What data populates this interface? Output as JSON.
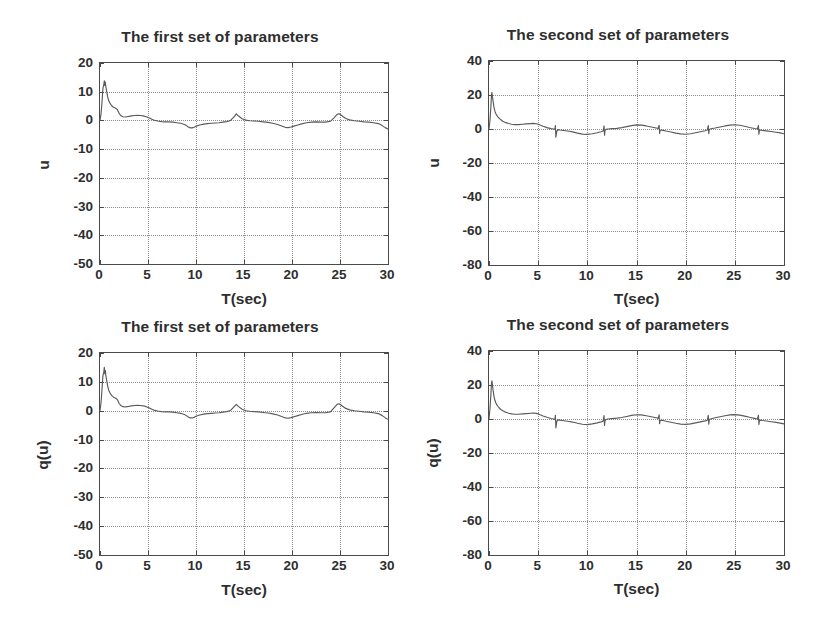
{
  "figure": {
    "background": "#ffffff",
    "line_color": "#5a5a5a",
    "axis_color": "#4a4a4a",
    "grid_color": "#8d8d8d"
  },
  "panels": [
    {
      "id": "top-left",
      "title": "The first set of parameters",
      "xlabel": "T(sec)",
      "ylabel": "u",
      "xticks": [
        "0",
        "5",
        "10",
        "15",
        "20",
        "25",
        "30"
      ],
      "yticks": [
        "20",
        "10",
        "0",
        "-10",
        "-20",
        "-30",
        "-40",
        "-50"
      ]
    },
    {
      "id": "top-right",
      "title": "The second set of parameters",
      "xlabel": "T(sec)",
      "ylabel": "u",
      "xticks": [
        "0",
        "5",
        "10",
        "15",
        "20",
        "25",
        "30"
      ],
      "yticks": [
        "40",
        "20",
        "0",
        "-20",
        "-40",
        "-60",
        "-80"
      ]
    },
    {
      "id": "bottom-left",
      "title": "The first set of parameters",
      "xlabel": "T(sec)",
      "ylabel": "q(u)",
      "xticks": [
        "0",
        "5",
        "10",
        "15",
        "20",
        "25",
        "30"
      ],
      "yticks": [
        "20",
        "10",
        "0",
        "-10",
        "-20",
        "-30",
        "-40",
        "-50"
      ]
    },
    {
      "id": "bottom-right",
      "title": "The second set of parameters",
      "xlabel": "T(sec)",
      "ylabel": "q(u)",
      "xticks": [
        "0",
        "5",
        "10",
        "15",
        "20",
        "25",
        "30"
      ],
      "yticks": [
        "40",
        "20",
        "0",
        "-20",
        "-40",
        "-60",
        "-80"
      ]
    }
  ],
  "chart_data": [
    {
      "type": "line",
      "id": "top-left",
      "title": "The first set of parameters",
      "xlabel": "T(sec)",
      "ylabel": "u",
      "xlim": [
        0,
        30
      ],
      "ylim": [
        -50,
        20
      ],
      "xticks": [
        0,
        5,
        10,
        15,
        20,
        25,
        30
      ],
      "yticks": [
        -50,
        -40,
        -30,
        -20,
        -10,
        0,
        10,
        20
      ],
      "grid": true,
      "legend": null,
      "series": [
        {
          "name": "u",
          "x": [
            0.0,
            0.1,
            0.2,
            0.3,
            0.4,
            0.45,
            0.5,
            0.55,
            0.6,
            0.7,
            0.8,
            0.9,
            1.0,
            1.2,
            1.4,
            1.6,
            1.8,
            2.0,
            2.2,
            2.4,
            2.6,
            2.8,
            3.0,
            3.3,
            3.6,
            3.9,
            4.2,
            4.5,
            4.8,
            5.1,
            5.4,
            5.7,
            6.0,
            6.4,
            6.8,
            7.2,
            7.6,
            8.0,
            8.4,
            8.8,
            9.0,
            9.2,
            9.4,
            9.6,
            9.8,
            10.0,
            10.4,
            10.8,
            11.2,
            11.6,
            12.0,
            12.4,
            12.8,
            13.2,
            13.6,
            14.0,
            14.2,
            14.4,
            14.8,
            15.2,
            15.6,
            16.0,
            16.5,
            17.0,
            17.5,
            18.0,
            18.5,
            19.0,
            19.3,
            19.6,
            19.9,
            20.2,
            20.6,
            21.0,
            21.5,
            22.0,
            22.5,
            23.0,
            23.5,
            24.0,
            24.4,
            24.7,
            24.9,
            25.2,
            25.6,
            26.0,
            26.5,
            27.0,
            27.5,
            28.0,
            28.5,
            29.0,
            29.4,
            29.7,
            30.0
          ],
          "y": [
            0.0,
            2.0,
            6.0,
            11.0,
            12.6,
            13.8,
            12.2,
            13.4,
            12.0,
            10.0,
            8.2,
            7.0,
            6.2,
            5.2,
            4.6,
            4.3,
            3.8,
            2.4,
            1.6,
            1.3,
            1.2,
            1.3,
            1.4,
            1.6,
            1.7,
            1.8,
            1.7,
            1.6,
            1.3,
            0.9,
            0.4,
            0.0,
            -0.2,
            -0.4,
            -0.5,
            -0.5,
            -0.6,
            -0.8,
            -1.0,
            -1.4,
            -1.8,
            -2.3,
            -2.6,
            -2.6,
            -2.4,
            -2.0,
            -1.6,
            -1.3,
            -1.1,
            -1.0,
            -0.9,
            -0.8,
            -0.6,
            -0.4,
            0.0,
            1.4,
            2.3,
            1.6,
            0.6,
            0.1,
            -0.1,
            -0.2,
            -0.3,
            -0.5,
            -0.7,
            -1.0,
            -1.4,
            -2.0,
            -2.4,
            -2.5,
            -2.3,
            -2.0,
            -1.6,
            -1.2,
            -0.8,
            -0.6,
            -0.5,
            -0.6,
            -0.6,
            -0.3,
            1.0,
            2.1,
            2.3,
            1.6,
            0.7,
            0.2,
            -0.1,
            -0.3,
            -0.5,
            -0.6,
            -0.8,
            -1.1,
            -1.8,
            -2.5,
            -3.0
          ]
        }
      ]
    },
    {
      "type": "line",
      "id": "top-right",
      "title": "The second set of parameters",
      "xlabel": "T(sec)",
      "ylabel": "u",
      "xlim": [
        0,
        30
      ],
      "ylim": [
        -80,
        40
      ],
      "xticks": [
        0,
        5,
        10,
        15,
        20,
        25,
        30
      ],
      "yticks": [
        -80,
        -60,
        -40,
        -20,
        0,
        20,
        40
      ],
      "grid": true,
      "legend": null,
      "series": [
        {
          "name": "u",
          "x": [
            0.0,
            0.1,
            0.2,
            0.25,
            0.3,
            0.35,
            0.4,
            0.5,
            0.6,
            0.7,
            0.8,
            0.9,
            1.0,
            1.2,
            1.4,
            1.6,
            1.8,
            2.0,
            2.3,
            2.6,
            3.0,
            3.4,
            3.8,
            4.2,
            4.5,
            4.8,
            5.0,
            5.2,
            5.5,
            5.9,
            6.3,
            6.6,
            6.7,
            6.75,
            6.8,
            6.9,
            7.0,
            7.2,
            7.6,
            8.0,
            8.5,
            9.0,
            9.5,
            10.0,
            10.5,
            11.0,
            11.4,
            11.6,
            11.7,
            11.75,
            11.8,
            11.9,
            12.1,
            12.5,
            13.0,
            13.5,
            14.0,
            14.5,
            15.0,
            15.5,
            16.0,
            16.5,
            17.0,
            17.2,
            17.3,
            17.35,
            17.4,
            17.5,
            17.7,
            18.0,
            18.5,
            19.0,
            19.5,
            20.0,
            20.5,
            21.0,
            21.5,
            22.0,
            22.2,
            22.3,
            22.35,
            22.4,
            22.5,
            22.7,
            23.0,
            23.5,
            24.0,
            24.5,
            25.0,
            25.5,
            26.0,
            26.5,
            27.0,
            27.3,
            27.4,
            27.45,
            27.5,
            27.6,
            27.8,
            28.2,
            28.7,
            29.2,
            29.6,
            30.0
          ],
          "y": [
            0.0,
            5.0,
            14.0,
            20.0,
            21.5,
            19.0,
            17.0,
            13.0,
            10.5,
            9.0,
            8.0,
            7.2,
            6.5,
            5.4,
            4.6,
            4.0,
            3.6,
            3.2,
            2.8,
            2.6,
            2.6,
            2.8,
            3.0,
            3.2,
            3.3,
            3.1,
            2.8,
            2.3,
            1.6,
            0.8,
            0.2,
            0.0,
            -0.3,
            2.0,
            -4.8,
            -1.2,
            -0.4,
            -0.6,
            -0.9,
            -1.2,
            -1.7,
            -2.4,
            -3.0,
            -3.2,
            -2.8,
            -2.2,
            -1.6,
            -1.2,
            1.8,
            -3.6,
            -0.8,
            -0.2,
            0.0,
            0.2,
            0.4,
            0.8,
            1.4,
            2.0,
            2.4,
            2.3,
            1.8,
            1.2,
            0.6,
            0.3,
            2.2,
            -2.6,
            -0.8,
            -0.6,
            -0.8,
            -1.2,
            -1.8,
            -2.4,
            -2.9,
            -3.1,
            -2.8,
            -2.2,
            -1.6,
            -1.0,
            -0.6,
            2.0,
            -2.8,
            -0.4,
            0.0,
            0.3,
            0.6,
            1.2,
            1.8,
            2.3,
            2.5,
            2.2,
            1.6,
            0.9,
            0.3,
            0.0,
            2.1,
            -3.0,
            -0.8,
            -0.6,
            -0.8,
            -1.1,
            -1.5,
            -1.9,
            -2.3,
            -2.8
          ]
        }
      ]
    },
    {
      "type": "line",
      "id": "bottom-left",
      "title": "The first set of parameters",
      "xlabel": "T(sec)",
      "ylabel": "q(u)",
      "xlim": [
        0,
        30
      ],
      "ylim": [
        -50,
        20
      ],
      "xticks": [
        0,
        5,
        10,
        15,
        20,
        25,
        30
      ],
      "yticks": [
        -50,
        -40,
        -30,
        -20,
        -10,
        0,
        10,
        20
      ],
      "grid": true,
      "legend": null,
      "series": [
        {
          "name": "q(u)",
          "x": [
            0.0,
            0.1,
            0.2,
            0.3,
            0.4,
            0.45,
            0.5,
            0.55,
            0.6,
            0.7,
            0.8,
            0.9,
            1.0,
            1.2,
            1.4,
            1.6,
            1.8,
            2.0,
            2.2,
            2.4,
            2.6,
            2.8,
            3.0,
            3.3,
            3.6,
            3.9,
            4.2,
            4.5,
            4.8,
            5.1,
            5.4,
            5.7,
            6.0,
            6.4,
            6.8,
            7.2,
            7.6,
            8.0,
            8.4,
            8.8,
            9.0,
            9.2,
            9.4,
            9.6,
            9.8,
            10.0,
            10.4,
            10.8,
            11.2,
            11.6,
            12.0,
            12.4,
            12.8,
            13.2,
            13.6,
            14.0,
            14.2,
            14.4,
            14.8,
            15.2,
            15.6,
            16.0,
            16.5,
            17.0,
            17.5,
            18.0,
            18.5,
            19.0,
            19.3,
            19.6,
            19.9,
            20.2,
            20.6,
            21.0,
            21.5,
            22.0,
            22.5,
            23.0,
            23.5,
            24.0,
            24.4,
            24.7,
            24.9,
            25.2,
            25.6,
            26.0,
            26.5,
            27.0,
            27.5,
            28.0,
            28.5,
            29.0,
            29.4,
            29.7,
            30.0
          ],
          "y": [
            0.0,
            2.5,
            7.0,
            12.0,
            13.5,
            15.0,
            12.8,
            14.0,
            12.4,
            10.4,
            8.6,
            7.2,
            6.4,
            5.3,
            4.7,
            4.4,
            3.9,
            2.5,
            1.7,
            1.4,
            1.3,
            1.4,
            1.5,
            1.7,
            1.8,
            1.9,
            1.8,
            1.7,
            1.4,
            1.0,
            0.5,
            0.1,
            -0.1,
            -0.3,
            -0.4,
            -0.4,
            -0.5,
            -0.7,
            -0.9,
            -1.3,
            -1.7,
            -2.2,
            -2.5,
            -2.5,
            -2.3,
            -1.9,
            -1.5,
            -1.2,
            -1.0,
            -0.9,
            -0.8,
            -0.7,
            -0.5,
            -0.3,
            0.1,
            1.5,
            2.2,
            1.5,
            0.5,
            0.0,
            -0.2,
            -0.3,
            -0.4,
            -0.6,
            -0.8,
            -1.1,
            -1.5,
            -2.1,
            -2.5,
            -2.6,
            -2.4,
            -2.1,
            -1.7,
            -1.3,
            -0.9,
            -0.7,
            -0.6,
            -0.7,
            -0.7,
            -0.4,
            1.1,
            2.2,
            2.4,
            1.7,
            0.8,
            0.3,
            0.0,
            -0.2,
            -0.4,
            -0.5,
            -0.7,
            -1.0,
            -1.7,
            -2.4,
            -3.0
          ]
        }
      ]
    },
    {
      "type": "line",
      "id": "bottom-right",
      "title": "The second set of parameters",
      "xlabel": "T(sec)",
      "ylabel": "q(u)",
      "xlim": [
        0,
        30
      ],
      "ylim": [
        -80,
        40
      ],
      "xticks": [
        0,
        5,
        10,
        15,
        20,
        25,
        30
      ],
      "yticks": [
        -80,
        -60,
        -40,
        -20,
        0,
        20,
        40
      ],
      "grid": true,
      "legend": null,
      "series": [
        {
          "name": "q(u)",
          "x": [
            0.0,
            0.1,
            0.2,
            0.25,
            0.3,
            0.35,
            0.4,
            0.5,
            0.6,
            0.7,
            0.8,
            0.9,
            1.0,
            1.2,
            1.4,
            1.6,
            1.8,
            2.0,
            2.3,
            2.6,
            3.0,
            3.4,
            3.8,
            4.2,
            4.5,
            4.8,
            5.0,
            5.2,
            5.5,
            5.9,
            6.3,
            6.6,
            6.7,
            6.75,
            6.8,
            6.9,
            7.0,
            7.2,
            7.6,
            8.0,
            8.5,
            9.0,
            9.5,
            10.0,
            10.5,
            11.0,
            11.4,
            11.6,
            11.7,
            11.75,
            11.8,
            11.9,
            12.1,
            12.5,
            13.0,
            13.5,
            14.0,
            14.5,
            15.0,
            15.5,
            16.0,
            16.5,
            17.0,
            17.2,
            17.3,
            17.35,
            17.4,
            17.5,
            17.7,
            18.0,
            18.5,
            19.0,
            19.5,
            20.0,
            20.5,
            21.0,
            21.5,
            22.0,
            22.2,
            22.3,
            22.35,
            22.4,
            22.5,
            22.7,
            23.0,
            23.5,
            24.0,
            24.5,
            25.0,
            25.5,
            26.0,
            26.5,
            27.0,
            27.3,
            27.4,
            27.45,
            27.5,
            27.6,
            27.8,
            28.2,
            28.7,
            29.2,
            29.6,
            30.0
          ],
          "y": [
            0.0,
            6.0,
            15.0,
            21.0,
            22.5,
            20.0,
            17.5,
            13.5,
            11.0,
            9.4,
            8.3,
            7.5,
            6.8,
            5.6,
            4.8,
            4.2,
            3.8,
            3.4,
            3.0,
            2.8,
            2.8,
            3.0,
            3.2,
            3.4,
            3.5,
            3.3,
            3.0,
            2.5,
            1.8,
            1.0,
            0.3,
            0.0,
            -0.3,
            2.2,
            -5.2,
            -1.3,
            -0.5,
            -0.7,
            -1.0,
            -1.3,
            -1.8,
            -2.5,
            -3.1,
            -3.3,
            -2.9,
            -2.3,
            -1.7,
            -1.3,
            2.0,
            -3.8,
            -0.9,
            -0.3,
            0.0,
            0.2,
            0.5,
            0.9,
            1.5,
            2.1,
            2.5,
            2.4,
            1.9,
            1.3,
            0.7,
            0.4,
            2.4,
            -2.8,
            -0.9,
            -0.7,
            -0.9,
            -1.3,
            -1.9,
            -2.5,
            -3.0,
            -3.2,
            -2.9,
            -2.3,
            -1.7,
            -1.1,
            -0.7,
            2.2,
            -3.0,
            -0.5,
            0.0,
            0.3,
            0.7,
            1.3,
            1.9,
            2.4,
            2.6,
            2.3,
            1.7,
            1.0,
            0.4,
            0.0,
            2.2,
            -3.2,
            -0.9,
            -0.7,
            -0.9,
            -1.2,
            -1.6,
            -2.0,
            -2.4,
            -2.9
          ]
        }
      ]
    }
  ]
}
